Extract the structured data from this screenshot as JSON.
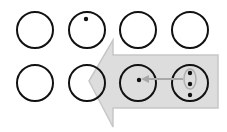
{
  "diagram": {
    "colors": {
      "background": "#ffffff",
      "circle_stroke": "#111111",
      "arrow_fill": "#d9d9d9",
      "arrow_stroke": "#bdbdbd",
      "dot": "#111111",
      "small_arrow": "#aaaaaa"
    },
    "rows": [
      {
        "circles": [
          {
            "dots": 0
          },
          {
            "dots": 1,
            "dot_position": "top"
          },
          {
            "dots": 0
          },
          {
            "dots": 0
          }
        ]
      },
      {
        "circles": [
          {
            "dots": 0
          },
          {
            "dots": 0
          },
          {
            "dots": 1,
            "dot_position": "center"
          },
          {
            "dots": 3,
            "dot_position": "vertical",
            "highlighted_group": true
          }
        ]
      }
    ],
    "big_arrow": {
      "direction": "left"
    },
    "small_arrow": {
      "direction": "left",
      "from": "row2-circle4",
      "to": "row2-circle3"
    }
  }
}
